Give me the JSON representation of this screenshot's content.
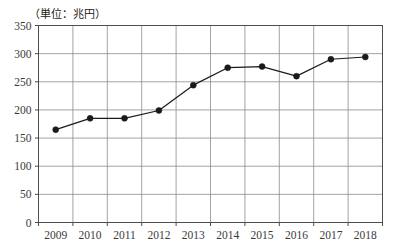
{
  "chart_data": {
    "type": "line",
    "title": "",
    "unit_note": "（単位：兆円）",
    "xlabel": "",
    "ylabel": "",
    "categories": [
      "2009",
      "2010",
      "2011",
      "2012",
      "2013",
      "2014",
      "2015",
      "2016",
      "2017",
      "2018"
    ],
    "values": [
      165,
      185,
      185,
      199,
      244,
      275,
      277,
      260,
      290,
      294
    ],
    "series": [
      {
        "name": "",
        "values": [
          165,
          185,
          185,
          199,
          244,
          275,
          277,
          260,
          290,
          294
        ]
      }
    ],
    "ylim": [
      0,
      350
    ],
    "yticks": [
      0,
      50,
      100,
      150,
      200,
      250,
      300,
      350
    ],
    "ytick_labels": [
      "0",
      "50",
      "100",
      "150",
      "200",
      "250",
      "300",
      "350"
    ],
    "grid": true,
    "grid_x": true,
    "grid_y": true,
    "legend": null,
    "marker": "circle-filled",
    "line_color": "#1a1a1a",
    "marker_color": "#1a1a1a",
    "grid_color": "#8c8c8c",
    "axis_color": "#4d4d4d",
    "background": "#ffffff"
  }
}
